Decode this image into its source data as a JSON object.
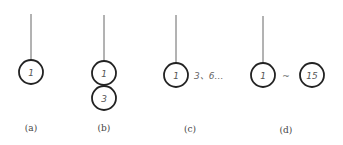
{
  "diagram": {
    "stroke_color": "#222222",
    "line_color": "#666666",
    "panels": [
      {
        "id": "a",
        "caption": "(a)",
        "nodes": [
          "1"
        ]
      },
      {
        "id": "b",
        "caption": "(b)",
        "nodes": [
          "1",
          "3"
        ]
      },
      {
        "id": "c",
        "caption": "(c)",
        "nodes": [
          "1"
        ],
        "side_label": "3、6…"
      },
      {
        "id": "d",
        "caption": "(d)",
        "nodes": [
          "1",
          "15"
        ],
        "connector": "~"
      }
    ]
  }
}
